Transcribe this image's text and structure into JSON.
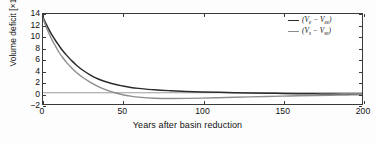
{
  "chart_data": {
    "type": "line",
    "title": "",
    "xlabel": "Years after basin reduction",
    "ylabel": "Volume deficit [×10⁶ m³]",
    "ylabel_base": "Volume deficit [×10",
    "ylabel_exp": "6",
    "ylabel_tail": " m³]",
    "xlim": [
      0,
      200
    ],
    "ylim": [
      -2,
      14
    ],
    "xticks": [
      0,
      50,
      100,
      150,
      200
    ],
    "yticks": [
      14,
      12,
      10,
      8,
      6,
      4,
      2,
      0,
      -2
    ],
    "grid": false,
    "zero_line": true,
    "legend_position": "top-right",
    "legend": [
      {
        "label": "(Vₑ − Vₑₑ)",
        "base1": "(V",
        "sub1": "e",
        "minus": " − V",
        "sub2": "ee",
        "close": ")",
        "color": "#2b2b2b"
      },
      {
        "label": "(Vₛ − Vₛₑ)",
        "base1": "(V",
        "sub1": "s",
        "minus": " − V",
        "sub2": "se",
        "close": ")",
        "color": "#8c8c8c"
      }
    ],
    "series": [
      {
        "name": "(Vₑ − Vₑₑ)",
        "color": "#2b2b2b",
        "width": 1.5,
        "x": [
          0,
          2,
          4,
          6,
          8,
          10,
          12,
          15,
          18,
          21,
          25,
          30,
          35,
          40,
          45,
          50,
          55,
          60,
          70,
          80,
          90,
          100,
          110,
          120,
          130,
          140,
          150,
          160,
          170,
          180,
          190,
          200
        ],
        "y": [
          13.4,
          12.2,
          11.1,
          10.1,
          9.2,
          8.4,
          7.6,
          6.6,
          5.7,
          4.9,
          4.0,
          3.1,
          2.4,
          1.9,
          1.5,
          1.2,
          0.95,
          0.78,
          0.52,
          0.36,
          0.24,
          0.15,
          0.08,
          0.02,
          -0.03,
          -0.08,
          -0.12,
          -0.16,
          -0.19,
          -0.22,
          -0.25,
          -0.28
        ]
      },
      {
        "name": "(Vₛ − Vₛₑ)",
        "color": "#8c8c8c",
        "width": 1.4,
        "x": [
          0,
          2,
          4,
          6,
          8,
          10,
          12,
          15,
          18,
          21,
          25,
          30,
          35,
          40,
          45,
          50,
          55,
          60,
          70,
          80,
          90,
          100,
          110,
          120,
          130,
          140,
          150,
          160,
          170,
          180,
          190,
          200
        ],
        "y": [
          13.2,
          11.7,
          10.4,
          9.2,
          8.2,
          7.2,
          6.4,
          5.3,
          4.4,
          3.6,
          2.7,
          1.8,
          1.05,
          0.45,
          0.0,
          -0.35,
          -0.6,
          -0.78,
          -0.97,
          -1.02,
          -1.0,
          -0.95,
          -0.88,
          -0.8,
          -0.73,
          -0.66,
          -0.6,
          -0.54,
          -0.49,
          -0.44,
          -0.4,
          -0.36
        ]
      }
    ]
  },
  "colors": {
    "frame": "#3a3a3a",
    "zero_line": "#9a9a9a",
    "background": "#ffffff",
    "text": "#111111"
  }
}
